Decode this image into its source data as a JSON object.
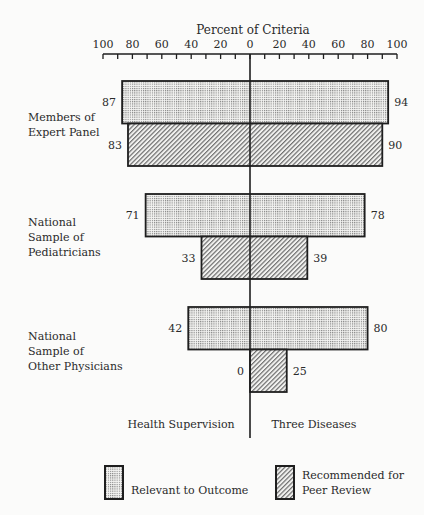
{
  "chart_data": {
    "type": "bar",
    "orientation": "horizontal-diverging",
    "title": "Percent of Criteria",
    "xlabel": "Percent of Criteria",
    "left_side_label": "Health Supervision",
    "right_side_label": "Three Diseases",
    "x_ticks_left": [
      100,
      80,
      60,
      40,
      20,
      0
    ],
    "x_ticks_right": [
      20,
      40,
      60,
      80,
      100
    ],
    "xlim": [
      -100,
      100
    ],
    "grid": false,
    "legend_position": "bottom",
    "categories": [
      [
        "Members of",
        "Expert Panel"
      ],
      [
        "National",
        "Sample of",
        "Pediatricians"
      ],
      [
        "National",
        "Sample of",
        "Other Physicians"
      ]
    ],
    "series": [
      {
        "name": "Relevant to Outcome",
        "pattern": "dotted",
        "health_supervision": [
          87,
          71,
          42
        ],
        "three_diseases": [
          94,
          78,
          80
        ]
      },
      {
        "name": "Recommended for Peer Review",
        "pattern": "hatched",
        "health_supervision": [
          83,
          33,
          0
        ],
        "three_diseases": [
          90,
          39,
          25
        ]
      }
    ]
  },
  "legend": {
    "items": [
      {
        "label_lines": [
          "Relevant to Outcome"
        ],
        "pattern": "dotted"
      },
      {
        "label_lines": [
          "Recommended for",
          "Peer Review"
        ],
        "pattern": "hatched"
      }
    ]
  },
  "colors": {
    "ink": "#1e1e1e",
    "background": "#fbfbfa",
    "dot": "#7a7a7a",
    "hatch": "#6e6e6e"
  }
}
